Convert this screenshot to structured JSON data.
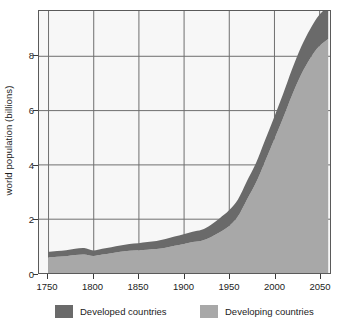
{
  "chart_data": {
    "type": "area",
    "stacked": true,
    "title": "",
    "subtitle": "",
    "xlabel": "",
    "ylabel": "world population (billions)",
    "xlim": [
      1740,
      2062
    ],
    "ylim": [
      0,
      9.65
    ],
    "xticks": [
      1750,
      1800,
      1850,
      1900,
      1950,
      2000,
      2050
    ],
    "yticks": [
      0,
      2,
      4,
      6,
      8
    ],
    "xtick_labels": [
      "1750",
      "1800",
      "1850",
      "1900",
      "1950",
      "2000",
      "2050"
    ],
    "ytick_labels": [
      "0",
      "2",
      "4",
      "6",
      "8"
    ],
    "grid": true,
    "grid_color": "#6e6e6e",
    "plot_background": "#f7f7f7",
    "legend_position": "below",
    "x": [
      1750,
      1760,
      1770,
      1780,
      1790,
      1800,
      1810,
      1820,
      1830,
      1840,
      1850,
      1860,
      1870,
      1880,
      1890,
      1900,
      1910,
      1920,
      1930,
      1940,
      1950,
      1960,
      1970,
      1980,
      1990,
      2000,
      2010,
      2020,
      2030,
      2040,
      2050,
      2060
    ],
    "series": [
      {
        "name": "Developing countries",
        "color": "#a8a8a8",
        "values": [
          0.58,
          0.6,
          0.62,
          0.66,
          0.68,
          0.63,
          0.68,
          0.73,
          0.78,
          0.82,
          0.84,
          0.86,
          0.88,
          0.93,
          1.0,
          1.07,
          1.14,
          1.19,
          1.32,
          1.5,
          1.72,
          2.08,
          2.7,
          3.32,
          4.1,
          4.9,
          5.7,
          6.55,
          7.3,
          7.9,
          8.35,
          8.62
        ],
        "unit": "billions"
      },
      {
        "name": "Developed countries",
        "color": "#6a6a6a",
        "values": [
          0.2,
          0.21,
          0.22,
          0.23,
          0.24,
          0.2,
          0.21,
          0.22,
          0.23,
          0.25,
          0.26,
          0.28,
          0.3,
          0.32,
          0.34,
          0.36,
          0.38,
          0.4,
          0.45,
          0.52,
          0.58,
          0.62,
          0.68,
          0.72,
          0.78,
          0.82,
          0.88,
          0.95,
          1.02,
          1.08,
          1.15,
          1.2
        ],
        "unit": "billions"
      }
    ],
    "totals": [
      0.78,
      0.81,
      0.84,
      0.89,
      0.92,
      0.83,
      0.89,
      0.95,
      1.01,
      1.07,
      1.1,
      1.14,
      1.18,
      1.25,
      1.34,
      1.43,
      1.52,
      1.59,
      1.77,
      2.02,
      2.3,
      2.7,
      3.38,
      4.04,
      4.88,
      5.72,
      6.58,
      7.5,
      8.32,
      8.98,
      9.5,
      9.82
    ]
  },
  "legend": {
    "entries": [
      {
        "label": "Developed countries",
        "color": "#6a6a6a"
      },
      {
        "label": "Developing countries",
        "color": "#a8a8a8"
      }
    ]
  }
}
